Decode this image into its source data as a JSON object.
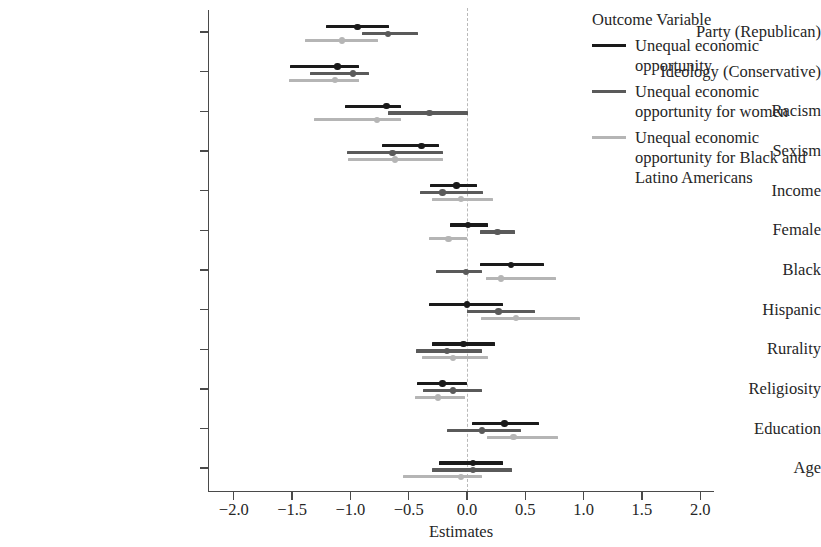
{
  "chart_data": {
    "type": "scatter",
    "plot_kind": "coefficient-forest-plot",
    "title": "",
    "xlabel": "Estimates",
    "ylabel": "",
    "xlim": [
      -2.35,
      2.35
    ],
    "xticks": [
      -2.0,
      -1.5,
      -1.0,
      -0.5,
      0.0,
      0.5,
      1.0,
      1.5,
      2.0
    ],
    "xticklabels": [
      "−2.0",
      "−1.5",
      "−1.0",
      "−0.5",
      "0.0",
      "0.5",
      "1.0",
      "1.5",
      "2.0"
    ],
    "grid": false,
    "zero_reference_line": 0.0,
    "legend_position": "right",
    "legend_title": "Outcome Variable",
    "categories": [
      "Party (Republican)",
      "Ideology (Conservative)",
      "Racism",
      "Sexism",
      "Income",
      "Female",
      "Black",
      "Hispanic",
      "Rurality",
      "Religiosity",
      "Education",
      "Age"
    ],
    "series": [
      {
        "name": "Unequal economic opportunity",
        "color": "#1a1a1a",
        "estimates": [
          -0.94,
          -1.11,
          -0.69,
          -0.39,
          -0.09,
          0.01,
          0.38,
          0.0,
          -0.03,
          -0.21,
          0.32,
          0.05
        ],
        "ci_low": [
          -1.21,
          -1.52,
          -1.05,
          -0.73,
          -0.32,
          -0.15,
          0.11,
          -0.33,
          -0.3,
          -0.43,
          0.04,
          -0.24
        ],
        "ci_high": [
          -0.67,
          -0.93,
          -0.57,
          -0.24,
          0.09,
          0.18,
          0.66,
          0.31,
          0.24,
          0.0,
          0.62,
          0.31
        ]
      },
      {
        "name": "Unequal economic opportunity for women",
        "color": "#5a5a5a",
        "estimates": [
          -0.68,
          -0.98,
          -0.32,
          -0.64,
          -0.21,
          0.26,
          -0.01,
          0.27,
          -0.17,
          -0.12,
          0.13,
          0.05
        ],
        "ci_low": [
          -0.9,
          -1.35,
          -0.68,
          -1.03,
          -0.4,
          0.11,
          -0.27,
          0.0,
          -0.44,
          -0.38,
          -0.17,
          -0.3
        ],
        "ci_high": [
          -0.42,
          -0.84,
          0.01,
          -0.21,
          0.14,
          0.41,
          0.13,
          0.58,
          0.13,
          0.13,
          0.46,
          0.39
        ]
      },
      {
        "name": "Unequal economic opportunity for Black and Latino Americans",
        "color": "#b5b5b5",
        "estimates": [
          -1.07,
          -1.13,
          -0.77,
          -0.62,
          -0.05,
          -0.16,
          0.29,
          0.42,
          -0.12,
          -0.25,
          0.4,
          -0.05
        ],
        "ci_low": [
          -1.39,
          -1.53,
          -1.31,
          -1.02,
          -0.3,
          -0.33,
          0.16,
          0.12,
          -0.39,
          -0.45,
          0.17,
          -0.55
        ],
        "ci_high": [
          -0.76,
          -0.93,
          -0.57,
          -0.21,
          0.22,
          0.0,
          0.76,
          0.97,
          0.18,
          -0.02,
          0.78,
          0.13
        ]
      }
    ]
  },
  "legend": {
    "title": "Outcome Variable",
    "items": [
      {
        "label": "Unequal economic opportunity",
        "color": "#1a1a1a"
      },
      {
        "label": "Unequal economic opportunity for women",
        "color": "#5a5a5a"
      },
      {
        "label": "Unequal economic opportunity for Black and Latino Americans",
        "color": "#b5b5b5"
      }
    ]
  },
  "axis": {
    "x_title": "Estimates"
  }
}
